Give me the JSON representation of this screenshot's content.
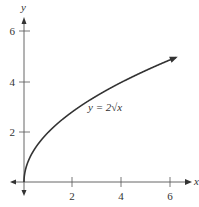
{
  "chart_data": {
    "type": "line",
    "title": "",
    "xlabel": "x",
    "ylabel": "y",
    "annotation": "y = 2√x",
    "function": "y = 2*sqrt(x)",
    "x": [
      0,
      0.25,
      0.5,
      1,
      2,
      3,
      4,
      5,
      6.2
    ],
    "series": [
      {
        "name": "y = 2√x",
        "values": [
          0,
          1.0,
          1.41,
          2.0,
          2.83,
          3.46,
          4.0,
          4.47,
          4.98
        ]
      }
    ],
    "xticks": [
      "2",
      "4",
      "6"
    ],
    "yticks": [
      "2",
      "4",
      "6"
    ],
    "xlim": [
      0,
      6.5
    ],
    "ylim": [
      0,
      6.5
    ],
    "grid": false,
    "legend": "none"
  },
  "labels": {
    "x_axis": "x",
    "y_axis": "y",
    "curve": "y = 2√x",
    "xtick_2": "2",
    "xtick_4": "4",
    "xtick_6": "6",
    "ytick_2": "2",
    "ytick_4": "4",
    "ytick_6": "6"
  }
}
